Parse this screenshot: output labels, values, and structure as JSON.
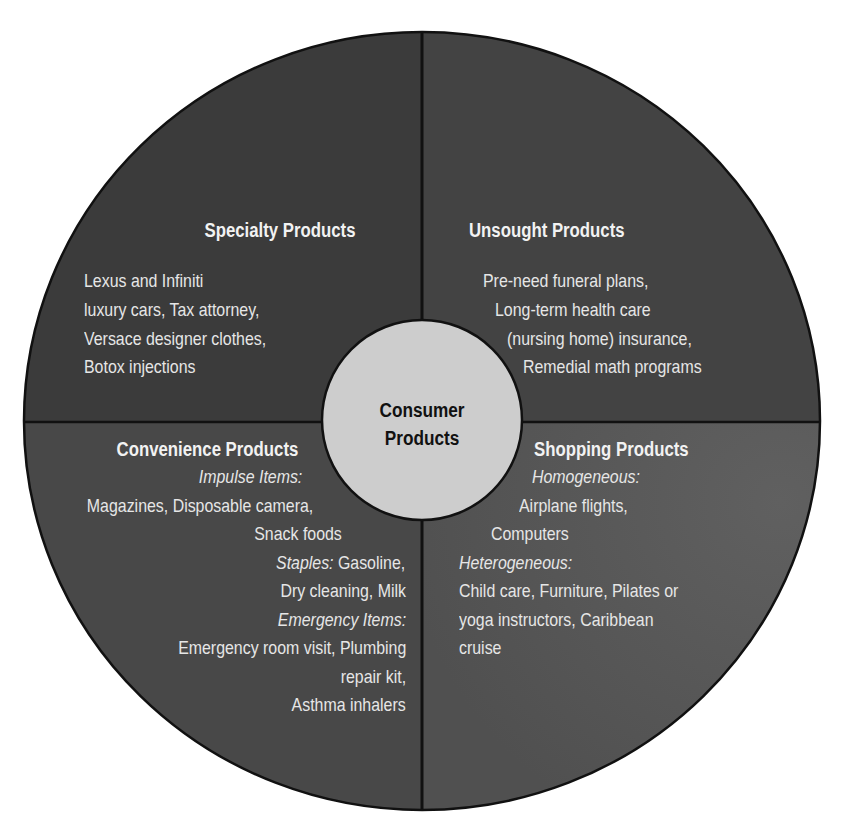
{
  "diagram": {
    "type": "quadrant-circle",
    "center": {
      "label_line1": "Consumer",
      "label_line2": "Products"
    },
    "colors": {
      "background": "#ffffff",
      "outline": "#111111",
      "specialty_fill": "#3b3b3b",
      "unsought_fill": "#434343",
      "convenience_fill": "#484848",
      "shopping_fill": "#575757",
      "center_fill": "#cdcdcd",
      "text": "#e6e6e6",
      "center_text": "#111111"
    },
    "quadrants": {
      "specialty": {
        "position": "top-left",
        "title": "Specialty Products",
        "lines": [
          "Lexus and Infiniti",
          "luxury cars, Tax attorney,",
          "Versace designer clothes,",
          "Botox injections"
        ]
      },
      "unsought": {
        "position": "top-right",
        "title": "Unsought Products",
        "lines": [
          "Pre-need funeral plans,",
          "Long-term health care",
          "(nursing home) insurance,",
          "Remedial math programs"
        ]
      },
      "convenience": {
        "position": "bottom-left",
        "title": "Convenience Products",
        "impulse_label": "Impulse Items:",
        "impulse_lines": [
          "Magazines, Disposable camera,",
          "Snack foods"
        ],
        "staples_label": "Staples:",
        "staples_lines": [
          "Gasoline,",
          "Dry cleaning, Milk"
        ],
        "emergency_label": "Emergency Items:",
        "emergency_lines": [
          "Emergency room visit, Plumbing",
          "repair kit,",
          "Asthma inhalers"
        ]
      },
      "shopping": {
        "position": "bottom-right",
        "title": "Shopping Products",
        "homogeneous_label": "Homogeneous:",
        "homogeneous_lines": [
          "Airplane flights,",
          "Computers"
        ],
        "heterogeneous_label": "Heterogeneous:",
        "heterogeneous_lines": [
          "Child care, Furniture, Pilates or",
          "yoga instructors, Caribbean",
          "cruise"
        ]
      }
    }
  }
}
